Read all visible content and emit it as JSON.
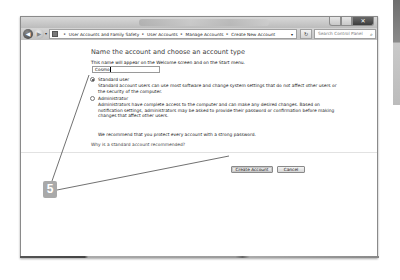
{
  "window": {
    "title": "Create New Account",
    "caption_buttons": {
      "minimize": "–",
      "maximize": "□",
      "close": "✕"
    }
  },
  "nav": {
    "back_icon": "◀",
    "forward_icon": "▶",
    "history_icon": "▾",
    "breadcrumb": [
      "User Accounts and Family Safety",
      "User Accounts",
      "Manage Accounts",
      "Create New Account"
    ],
    "separator": "▸",
    "address_dropdown_icon": "▾",
    "refresh_icon": "↻",
    "search_placeholder": "Search Control Panel",
    "search_icon": "⌕"
  },
  "main": {
    "heading": "Name the account and choose an account type",
    "subtitle": "This name will appear on the Welcome screen and on the Start menu.",
    "name_value": "Cosmo",
    "account_types": [
      {
        "label": "Standard user",
        "checked": true,
        "description": "Standard account users can use most software and change system settings that do not affect other users or the security of the computer."
      },
      {
        "label": "Administrator",
        "checked": false,
        "description": "Administrators have complete access to the computer and can make any desired changes. Based on notification settings, administrators may be asked to provide their password or confirmation before making changes that affect other users."
      }
    ],
    "recommendation": "We recommend that you protect every account with a strong password.",
    "why_link": "Why is a standard account recommended?",
    "create_button": "Create Account",
    "cancel_button": "Cancel"
  },
  "callout": {
    "step_number": "5",
    "color": "#a9a9a9"
  }
}
